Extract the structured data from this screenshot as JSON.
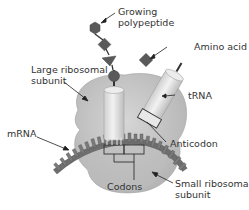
{
  "diagram": {
    "type": "ribosome-translation",
    "labels": {
      "growing_polypeptide": [
        "Growing",
        "polypeptide"
      ],
      "amino_acid": "Amino acid",
      "large_subunit": [
        "Large ribosomal",
        "subunit"
      ],
      "trna": "tRNA",
      "mrna": "mRNA",
      "anticodon": "Anticodon",
      "codons": "Codons",
      "small_subunit": [
        "Small ribosomal",
        "subunit"
      ]
    },
    "colors": {
      "ribosome": "#c8c8c8",
      "ribosome_shade": "#b4b4b4",
      "trna": "#e4e4e4",
      "amino_acid": "#5a5a5a",
      "mrna": "#6e6e6e",
      "text": "#333333"
    },
    "polypeptide_shapes": [
      "hexagon",
      "diamond",
      "triangle",
      "circle"
    ]
  }
}
